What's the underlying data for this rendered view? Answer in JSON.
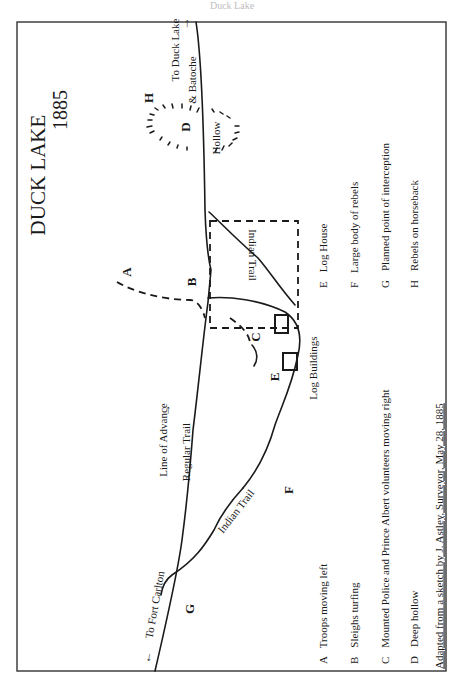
{
  "page_header": "Duck Lake",
  "map": {
    "title": "DUCK LAKE",
    "year": "1885",
    "labels": {
      "to_duck_lake": "To Duck Lake",
      "and_batoche": "& Batoche",
      "hollow": "Hollow",
      "indian_trail_upper": "Indian Trail",
      "indian_trail_lower": "Indian Trail",
      "regular_trail": "Regular Trail",
      "line_of_advance": "Line of Advance",
      "to_fort_carlton": "To Fort Carlton",
      "log_buildings": "Log Buildings"
    },
    "markers": {
      "A": "A",
      "B": "B",
      "C": "C",
      "D": "D",
      "E": "E",
      "F": "F",
      "G": "G",
      "H": "H"
    }
  },
  "legend": [
    {
      "key": "A",
      "text": "Troops moving left"
    },
    {
      "key": "B",
      "text": "Sleighs turfing"
    },
    {
      "key": "C",
      "text": "Mounted Police and Prince Albert volunteers moving right"
    },
    {
      "key": "D",
      "text": "Deep hollow"
    },
    {
      "key": "E",
      "text": "Log House"
    },
    {
      "key": "F",
      "text": "Large body of rebels"
    },
    {
      "key": "G",
      "text": "Planned point of interception"
    },
    {
      "key": "H",
      "text": "Rebels on horseback"
    }
  ],
  "credit": "Adapted from a sketch by J. Astley, Surveyor, May 28, 1885"
}
